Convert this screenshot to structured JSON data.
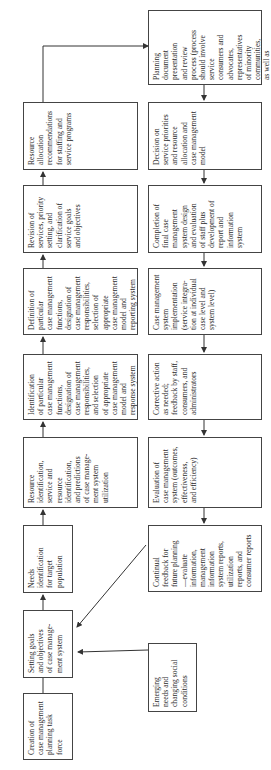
{
  "diagram": {
    "orientation": "rotated 90 degrees counter-clockwise (text reads bottom-to-top)",
    "top_row": [
      {
        "id": "creation",
        "text": "Creation of\ncase management\nplanning task\nforce"
      },
      {
        "id": "setting_goals",
        "text": "Setting goals\nand objectives\nof case manage-\nment system"
      },
      {
        "id": "needs",
        "text": "Needs\nidentification\nfor target\npopulation"
      },
      {
        "id": "resource_identification",
        "text": "Resource\nidentification,\nservice and\nresource\nidentification,\nand predictions\nof case manage-\nment system\nutilization"
      },
      {
        "id": "identification",
        "text": "Identification\nof particular\ncase management\nfunctions,\ndesignation of\ncase management\nresponsibilities,\nand selection\nof appropriate\ncase management\nmodel and\nresponse system"
      },
      {
        "id": "definition",
        "text": "Definition of\nparticular\ncase management\nfunctions,\ndesignation of\ncase management\nresponsibilities,\nselection of\nappropriate\ncase management\nmodel and\nreporting system"
      },
      {
        "id": "revision",
        "text": "Revision of\nservices, priority\nsetting, and\nclarification of\nservice goals\nand objectives"
      },
      {
        "id": "resource_allocation",
        "text": "Resource\nallocation\nrecommendations\nfor staffing and\nservice programs"
      }
    ],
    "bottom_row": [
      {
        "id": "planning_document",
        "text": "Planning\ndocument\npresentation\nand review\nprocess (process\nshould involve\nservice\nconsumers and\nadvocates,\nrepresentatives\nof minority\ncommunities,\nas well as\nconstituent\nagency and\nsanctioning body)"
      },
      {
        "id": "decision",
        "text": "Decision on\nservice priorities\nand resource\nallocation and\ncase management\nmodel"
      },
      {
        "id": "completion",
        "text": "Completion of\nfinal case\nmanagement\nsystem design\nand evaluation\nof staff plus\ndevelopment of\nreport and\ninformation\nsystem"
      },
      {
        "id": "implementation",
        "text": "Case management\nsystem\nimplementation\n(service integra-\ntion at individual\ncase level and\nsystem level)"
      },
      {
        "id": "corrective_action",
        "text": "Corrective action\nas needed;\nfeedback by staff,\nconsumers, and\nadministrators"
      },
      {
        "id": "evaluation",
        "text": "Evaluation of\ncase management\nsystem (outcomes,\neffectiveness,\nand efficiency)"
      },
      {
        "id": "continual_feedback",
        "text": "Continual\nfeedback for\nfuture planning\n—evaluate\ninformation,\nmanagement\ninformation\nsystem reports,\nutilization\nreports, and\nconsumer reports"
      },
      {
        "id": "emerging_needs",
        "text": "Emerging\nneeds and\nchanging social\nconditions"
      }
    ],
    "connections": [
      [
        "creation",
        "setting_goals"
      ],
      [
        "setting_goals",
        "needs"
      ],
      [
        "needs",
        "resource_identification"
      ],
      [
        "resource_identification",
        "identification"
      ],
      [
        "identification",
        "definition"
      ],
      [
        "definition",
        "revision"
      ],
      [
        "revision",
        "resource_allocation"
      ],
      [
        "resource_allocation",
        "planning_document"
      ],
      [
        "planning_document",
        "decision"
      ],
      [
        "decision",
        "completion"
      ],
      [
        "completion",
        "implementation"
      ],
      [
        "implementation",
        "corrective_action"
      ],
      [
        "corrective_action",
        "evaluation"
      ],
      [
        "evaluation",
        "continual_feedback"
      ],
      [
        "continual_feedback",
        "setting_goals"
      ],
      [
        "emerging_needs",
        "setting_goals"
      ]
    ],
    "colors": {
      "line": "#333333",
      "text": "#2b2b2b",
      "background": "#ffffff"
    }
  }
}
